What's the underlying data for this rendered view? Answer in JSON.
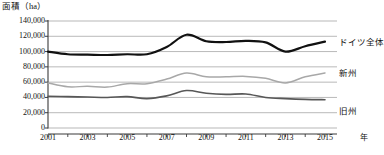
{
  "chart_data": {
    "type": "line",
    "title": "",
    "ylabel": "面積（ha）",
    "xlabel": "年",
    "ylim": [
      0,
      140000
    ],
    "xlim": [
      2001,
      2015
    ],
    "grid": true,
    "legend_position": "right-inline",
    "y_ticks": [
      0,
      20000,
      40000,
      60000,
      80000,
      100000,
      120000,
      140000
    ],
    "y_tick_labels": [
      "0",
      "20,000",
      "40,000",
      "60,000",
      "80,000",
      "100,000",
      "120,000",
      "140,000"
    ],
    "x_ticks": [
      2001,
      2002,
      2003,
      2004,
      2005,
      2006,
      2007,
      2008,
      2009,
      2010,
      2011,
      2012,
      2013,
      2014,
      2015
    ],
    "x_tick_labels": [
      "2001",
      "",
      "2003",
      "",
      "2005",
      "",
      "2007",
      "",
      "2009",
      "",
      "2011",
      "",
      "2013",
      "",
      "2015"
    ],
    "x_axis_unit": "年",
    "x": [
      2001,
      2002,
      2003,
      2004,
      2005,
      2006,
      2007,
      2008,
      2009,
      2010,
      2011,
      2012,
      2013,
      2014,
      2015
    ],
    "series": [
      {
        "name": "ドイツ全体",
        "color": "#111111",
        "width": 2.2,
        "values": [
          100000,
          96500,
          96000,
          95500,
          96500,
          96500,
          106000,
          122000,
          113500,
          112500,
          114000,
          112000,
          100000,
          107000,
          113000
        ]
      },
      {
        "name": "新州",
        "color": "#a8a8a8",
        "width": 1.5,
        "values": [
          59000,
          54000,
          54500,
          53500,
          58000,
          58000,
          64000,
          72000,
          67000,
          67000,
          67500,
          65000,
          59000,
          67000,
          72000
        ]
      },
      {
        "name": "旧州",
        "color": "#575757",
        "width": 1.6,
        "values": [
          41500,
          41000,
          40500,
          40000,
          41000,
          38500,
          42000,
          49000,
          45500,
          44000,
          44500,
          40000,
          38500,
          37500,
          37000
        ]
      }
    ]
  },
  "labels": {
    "y_axis_title": "面積（ha）",
    "x_axis_unit": "年",
    "series_germany": "ドイツ全体",
    "series_new": "新州",
    "series_old": "旧州"
  }
}
